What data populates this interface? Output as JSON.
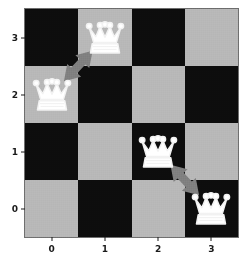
{
  "chart_data": {
    "type": "heatmap",
    "title": "",
    "xlabel": "",
    "ylabel": "",
    "board_size": 4,
    "x": [
      0,
      1,
      2,
      3
    ],
    "y": [
      0,
      1,
      2,
      3
    ],
    "xticks": [
      "0",
      "1",
      "2",
      "3"
    ],
    "yticks": [
      "3",
      "2",
      "1",
      "0"
    ],
    "xlim": [
      -0.5,
      3.5
    ],
    "ylim": [
      -0.5,
      3.5
    ],
    "grid": false,
    "legend": "none",
    "colors": {
      "dark_square": "#0d0d0d",
      "light_square": "#b8b8b8",
      "arrow": "#808080",
      "piece_outline": "#f2f2f2",
      "piece_fill": "#ffffff",
      "background": "#ffffff",
      "tick_text": "#1a1a1a",
      "board_border": "#6e6e6e"
    },
    "squares": [
      {
        "col": 0,
        "row": 3,
        "shade": "dark"
      },
      {
        "col": 1,
        "row": 3,
        "shade": "light"
      },
      {
        "col": 2,
        "row": 3,
        "shade": "dark"
      },
      {
        "col": 3,
        "row": 3,
        "shade": "light"
      },
      {
        "col": 0,
        "row": 2,
        "shade": "light"
      },
      {
        "col": 1,
        "row": 2,
        "shade": "dark"
      },
      {
        "col": 2,
        "row": 2,
        "shade": "light"
      },
      {
        "col": 3,
        "row": 2,
        "shade": "dark"
      },
      {
        "col": 0,
        "row": 1,
        "shade": "dark"
      },
      {
        "col": 1,
        "row": 1,
        "shade": "light"
      },
      {
        "col": 2,
        "row": 1,
        "shade": "dark"
      },
      {
        "col": 3,
        "row": 1,
        "shade": "light"
      },
      {
        "col": 0,
        "row": 0,
        "shade": "light"
      },
      {
        "col": 1,
        "row": 0,
        "shade": "dark"
      },
      {
        "col": 2,
        "row": 0,
        "shade": "light"
      },
      {
        "col": 3,
        "row": 0,
        "shade": "dark"
      }
    ],
    "pieces": [
      {
        "name": "queen",
        "glyph": "white-queen",
        "col": 1,
        "row": 3,
        "label": "Queen at column 1, row 3"
      },
      {
        "name": "queen",
        "glyph": "white-queen",
        "col": 0,
        "row": 2,
        "label": "Queen at column 0, row 2"
      },
      {
        "name": "queen",
        "glyph": "white-queen",
        "col": 2,
        "row": 1,
        "label": "Queen at column 2, row 1"
      },
      {
        "name": "queen",
        "glyph": "white-queen",
        "col": 3,
        "row": 0,
        "label": "Queen at column 3, row 0"
      }
    ],
    "arrows": [
      {
        "name": "conflict-arrow-upper",
        "style": "double-headed",
        "from": {
          "col": 0,
          "row": 2
        },
        "to": {
          "col": 1,
          "row": 3
        },
        "label": "Conflict between queen at (0,2) and queen at (1,3)"
      },
      {
        "name": "conflict-arrow-lower",
        "style": "double-headed",
        "from": {
          "col": 2,
          "row": 1
        },
        "to": {
          "col": 3,
          "row": 0
        },
        "label": "Conflict between queen at (2,1) and queen at (3,0)"
      }
    ]
  },
  "axes": {
    "x_tick_labels": [
      "0",
      "1",
      "2",
      "3"
    ],
    "y_tick_labels": [
      "3",
      "2",
      "1",
      "0"
    ]
  }
}
